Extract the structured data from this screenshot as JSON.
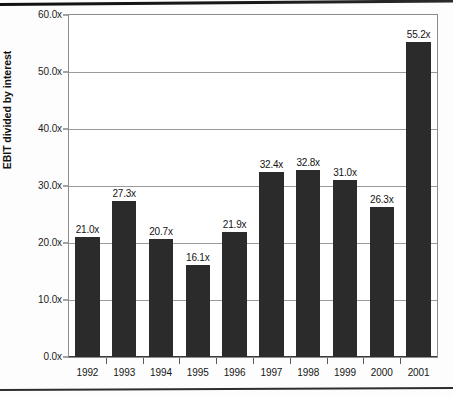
{
  "chart_data": {
    "type": "bar",
    "title": "",
    "xlabel": "",
    "ylabel": "EBIT divided by interest",
    "categories": [
      "1992",
      "1993",
      "1994",
      "1995",
      "1996",
      "1997",
      "1998",
      "1999",
      "2000",
      "2001"
    ],
    "values": [
      21.0,
      27.3,
      20.7,
      16.1,
      21.9,
      32.4,
      32.8,
      31.0,
      26.3,
      55.2
    ],
    "data_labels": [
      "21.0x",
      "27.3x",
      "20.7x",
      "16.1x",
      "21.9x",
      "32.4x",
      "32.8x",
      "31.0x",
      "26.3x",
      "55.2x"
    ],
    "ylim": [
      0,
      60
    ],
    "ytick_values": [
      0,
      10,
      20,
      30,
      40,
      50,
      60
    ],
    "ytick_labels": [
      "0.0x",
      "10.0x",
      "20.0x",
      "30.0x",
      "40.0x",
      "50.0x",
      "60.0x"
    ],
    "grid": true,
    "legend": false,
    "bar_color": "#2b2b2b",
    "gridline_color": "#9a9a9a",
    "plot_border_color": "#8c8c8c",
    "text_color": "#151515"
  }
}
